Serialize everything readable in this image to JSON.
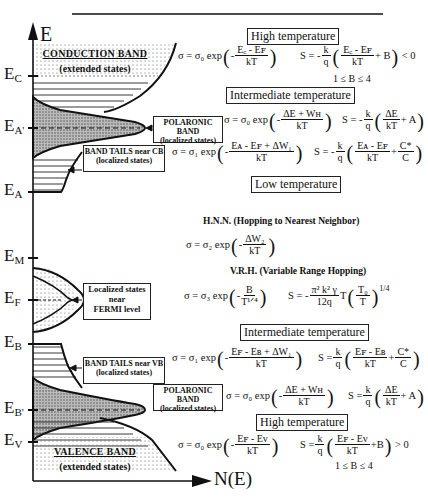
{
  "axes": {
    "y_label": "E",
    "x_label": "N(E)"
  },
  "energy_levels": [
    {
      "id": "EC",
      "label": "E",
      "sub": "C"
    },
    {
      "id": "EA_prime",
      "label": "E",
      "sub": "A'"
    },
    {
      "id": "EA",
      "label": "E",
      "sub": "A"
    },
    {
      "id": "EM",
      "label": "E",
      "sub": "M"
    },
    {
      "id": "EF",
      "label": "E",
      "sub": "F"
    },
    {
      "id": "EB",
      "label": "E",
      "sub": "B"
    },
    {
      "id": "EB_prime",
      "label": "E",
      "sub": "B'"
    },
    {
      "id": "EV",
      "label": "E",
      "sub": "V"
    }
  ],
  "regions": {
    "conduction_band": {
      "title": "CONDUCTION BAND",
      "subtitle": "(extended states)"
    },
    "valence_band": {
      "title": "VALENCE BAND",
      "subtitle": "(extended states)"
    },
    "polaronic_cb": {
      "line1": "POLARONIC BAND",
      "line2": "(localized states)"
    },
    "band_tails_cb": {
      "line1": "BAND TAILS near CB",
      "line2": "(localized states)"
    },
    "fermi_localized": {
      "line1": "Localized states",
      "line2": "near",
      "line3": "FERMI level"
    },
    "band_tails_vb": {
      "line1": "BAND TAILS near VB",
      "line2": "(localized states)"
    },
    "polaronic_vb": {
      "line1": "POLARONIC BAND",
      "line2": "(localized states)"
    }
  },
  "headers": {
    "high_top": "High temperature",
    "intermediate_top": "Intermediate temperature",
    "low": "Low temperature",
    "intermediate_bottom": "Intermediate temperature",
    "high_bottom": "High temperature"
  },
  "notes": {
    "hnn": "H.N.N. (Hopping to Nearest Neighbor)",
    "vrh": "V.R.H. (Variable Range Hopping)",
    "b_range_top": "1 ≤ B ≤ 4",
    "b_range_bottom": "1 ≤ B ≤ 4"
  },
  "equations": {
    "high_top": {
      "sigma_pre": "σ = σ₀ exp",
      "sigma_sign": "-",
      "sigma_num": "E꜀ - Eꜰ",
      "sigma_den": "kT",
      "s_pre": "S = - ",
      "s_k": "k",
      "s_q": "q",
      "s_num": "E꜀ - Eꜰ",
      "s_den": "kT",
      "s_post": "+ B",
      "s_tail": "< 0"
    },
    "intermediate_top": {
      "sigma_pre": "σ = σ₀ exp",
      "sigma_sign": "-",
      "sigma_num": "ΔE + Wʜ",
      "sigma_den": "kT",
      "s_pre": "S = - ",
      "s_k": "k",
      "s_q": "q",
      "s_num": "ΔE",
      "s_den": "kT",
      "s_post": "+ A"
    },
    "band_tail_cb": {
      "sigma_pre": "σ = σ₁ exp",
      "sigma_sign": "-",
      "sigma_num": "Eᴀ - Eꜰ + ΔW₁",
      "sigma_den": "kT",
      "s_pre": "S = - ",
      "s_k": "k",
      "s_q": "q",
      "s_num": "Eᴀ - Eꜰ",
      "s_den": "kT",
      "s_plus": "+",
      "s_cnum": "C*",
      "s_cden": "C"
    },
    "hnn": {
      "sigma_pre": "σ = σ₂ exp",
      "sigma_sign": "-",
      "sigma_num": "ΔW₂",
      "sigma_den": "kT"
    },
    "vrh": {
      "sigma_pre": "σ = σ₃ exp",
      "sigma_sign": "-",
      "sigma_num": "B",
      "sigma_den": "T¹ᐟ⁴",
      "s_pre": "S = - ",
      "s_num": "π² k² γ",
      "s_den": "12q",
      "s_t": "T",
      "s_tnum": "T₀",
      "s_tden": "T",
      "s_exp": "1/4"
    },
    "band_tail_vb": {
      "sigma_pre": "σ = σ₁ exp",
      "sigma_sign": "-",
      "sigma_num": "Eꜰ - Eʙ + ΔW₁",
      "sigma_den": "kT",
      "s_pre": "S = ",
      "s_k": "k",
      "s_q": "q",
      "s_num": "Eꜰ - Eʙ",
      "s_den": "kT",
      "s_plus": "+",
      "s_cnum": "C*",
      "s_cden": "C"
    },
    "intermediate_bottom": {
      "sigma_pre": "σ = σ₀ exp",
      "sigma_sign": "-",
      "sigma_num": "ΔE + Wʜ",
      "sigma_den": "kT",
      "s_pre": "S = ",
      "s_k": "k",
      "s_q": "q",
      "s_num": "ΔE",
      "s_den": "kT",
      "s_post": "+ A"
    },
    "high_bottom": {
      "sigma_pre": "σ = σ₀ exp",
      "sigma_sign": "-",
      "sigma_num": "Eꜰ - Eᴠ",
      "sigma_den": "kT",
      "s_pre": "S = ",
      "s_k": "k",
      "s_q": "q",
      "s_num": "Eꜰ - Eᴠ",
      "s_den": "kT",
      "s_post": "+B",
      "s_tail": "> 0"
    }
  }
}
